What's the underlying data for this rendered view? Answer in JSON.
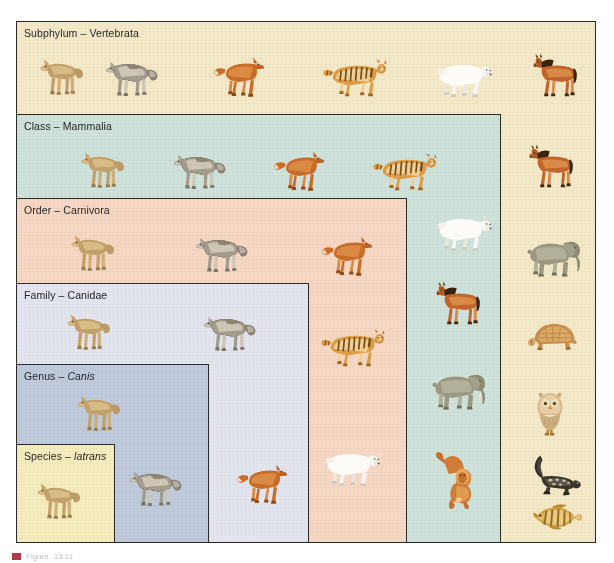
{
  "figure": {
    "caption_label": "Figure",
    "caption_text": "13.11",
    "accent_color": "#b03a4a",
    "border_color": "#2b2b28"
  },
  "ranks": [
    {
      "id": "subphylum",
      "label_rank": "Subphylum",
      "label_dash": " – ",
      "label_taxon": "Vertebrata",
      "italic": false,
      "color": "#f4e9c8",
      "x": 16,
      "y": 21,
      "w": 580,
      "h": 522,
      "animals": [
        "coyote",
        "wolf",
        "dhole",
        "tiger",
        "polar-bear",
        "horse",
        "elephant",
        "turtle",
        "owl",
        "salamander",
        "perch"
      ]
    },
    {
      "id": "class",
      "label_rank": "Class",
      "label_dash": " – ",
      "label_taxon": "Mammalia",
      "italic": false,
      "color": "#cfe3dc",
      "x": 16,
      "y": 114,
      "w": 485,
      "h": 429,
      "animals": [
        "coyote",
        "wolf",
        "dhole",
        "tiger",
        "polar-bear",
        "horse",
        "elephant",
        "orangutan"
      ]
    },
    {
      "id": "order",
      "label_rank": "Order",
      "label_dash": " – ",
      "label_taxon": "Carnivora",
      "italic": false,
      "color": "#f7d8c4",
      "x": 16,
      "y": 198,
      "w": 391,
      "h": 345,
      "animals": [
        "coyote",
        "wolf",
        "dhole",
        "tiger",
        "polar-bear"
      ]
    },
    {
      "id": "family",
      "label_rank": "Family",
      "label_dash": " – ",
      "label_taxon": "Canidae",
      "italic": false,
      "color": "#e4e6ef",
      "x": 16,
      "y": 283,
      "w": 293,
      "h": 260,
      "animals": [
        "coyote",
        "wolf",
        "dhole"
      ]
    },
    {
      "id": "genus",
      "label_rank": "Genus",
      "label_dash": " – ",
      "label_taxon": "Canis",
      "italic": true,
      "color": "#bfcbdd",
      "x": 16,
      "y": 364,
      "w": 193,
      "h": 179,
      "animals": [
        "coyote",
        "wolf"
      ]
    },
    {
      "id": "species",
      "label_rank": "Species",
      "label_dash": " – ",
      "label_taxon": "latrans",
      "italic": true,
      "color": "#f5edbe",
      "x": 16,
      "y": 444,
      "w": 99,
      "h": 99,
      "animals": [
        "coyote"
      ]
    }
  ],
  "animal_names": {
    "coyote": "coyote",
    "wolf": "wolf",
    "dhole": "dhole",
    "tiger": "tiger",
    "polar-bear": "polar-bear",
    "horse": "horse",
    "elephant": "elephant",
    "orangutan": "orangutan",
    "turtle": "turtle",
    "owl": "owl",
    "salamander": "salamander",
    "perch": "perch"
  },
  "animal_placements": [
    {
      "name": "coyote",
      "x": 31,
      "y": 48,
      "w": 58,
      "h": 52
    },
    {
      "name": "wolf",
      "x": 98,
      "y": 48,
      "w": 66,
      "h": 52
    },
    {
      "name": "dhole",
      "x": 212,
      "y": 49,
      "w": 62,
      "h": 50
    },
    {
      "name": "tiger",
      "x": 322,
      "y": 52,
      "w": 70,
      "h": 46
    },
    {
      "name": "polar-bear",
      "x": 432,
      "y": 52,
      "w": 62,
      "h": 46
    },
    {
      "name": "horse",
      "x": 527,
      "y": 50,
      "w": 58,
      "h": 48
    },
    {
      "name": "coyote",
      "x": 72,
      "y": 141,
      "w": 58,
      "h": 52
    },
    {
      "name": "wolf",
      "x": 166,
      "y": 141,
      "w": 66,
      "h": 52
    },
    {
      "name": "dhole",
      "x": 272,
      "y": 143,
      "w": 62,
      "h": 50
    },
    {
      "name": "tiger",
      "x": 372,
      "y": 146,
      "w": 70,
      "h": 46
    },
    {
      "name": "polar-bear",
      "x": 432,
      "y": 206,
      "w": 62,
      "h": 46
    },
    {
      "name": "horse",
      "x": 523,
      "y": 141,
      "w": 58,
      "h": 48
    },
    {
      "name": "horse",
      "x": 430,
      "y": 278,
      "w": 58,
      "h": 48
    },
    {
      "name": "elephant",
      "x": 523,
      "y": 229,
      "w": 62,
      "h": 50
    },
    {
      "name": "elephant",
      "x": 428,
      "y": 362,
      "w": 62,
      "h": 50
    },
    {
      "name": "turtle",
      "x": 527,
      "y": 314,
      "w": 54,
      "h": 42
    },
    {
      "name": "owl",
      "x": 531,
      "y": 390,
      "w": 38,
      "h": 48
    },
    {
      "name": "orangutan",
      "x": 430,
      "y": 448,
      "w": 56,
      "h": 62
    },
    {
      "name": "salamander",
      "x": 520,
      "y": 452,
      "w": 62,
      "h": 44
    },
    {
      "name": "perch",
      "x": 527,
      "y": 498,
      "w": 56,
      "h": 38
    },
    {
      "name": "coyote",
      "x": 62,
      "y": 224,
      "w": 58,
      "h": 52
    },
    {
      "name": "wolf",
      "x": 188,
      "y": 224,
      "w": 66,
      "h": 52
    },
    {
      "name": "dhole",
      "x": 320,
      "y": 228,
      "w": 62,
      "h": 50
    },
    {
      "name": "tiger",
      "x": 320,
      "y": 322,
      "w": 70,
      "h": 46
    },
    {
      "name": "polar-bear",
      "x": 320,
      "y": 441,
      "w": 62,
      "h": 46
    },
    {
      "name": "coyote",
      "x": 58,
      "y": 303,
      "w": 58,
      "h": 52
    },
    {
      "name": "wolf",
      "x": 196,
      "y": 303,
      "w": 66,
      "h": 52
    },
    {
      "name": "dhole",
      "x": 235,
      "y": 456,
      "w": 62,
      "h": 50
    },
    {
      "name": "coyote",
      "x": 68,
      "y": 384,
      "w": 58,
      "h": 52
    },
    {
      "name": "wolf",
      "x": 122,
      "y": 458,
      "w": 66,
      "h": 52
    },
    {
      "name": "coyote",
      "x": 28,
      "y": 472,
      "w": 58,
      "h": 52
    }
  ]
}
